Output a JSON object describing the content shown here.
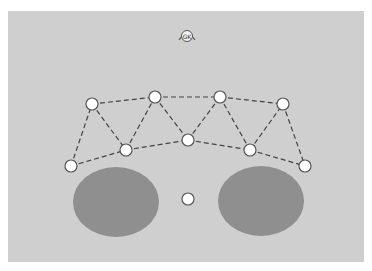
{
  "diagram": {
    "background_color": "#cfcfcf",
    "top_icon": {
      "name": "gk-badge-icon",
      "label": "GK",
      "x": 187,
      "y": 36
    },
    "ellipse_color": "#8f8f8f",
    "ellipses": [
      {
        "id": "left-blob",
        "cx": 116,
        "cy": 202,
        "rx": 43,
        "ry": 35
      },
      {
        "id": "right-blob",
        "cx": 261,
        "cy": 201,
        "rx": 43,
        "ry": 35
      }
    ],
    "node_style": {
      "fill": "#ffffff",
      "stroke": "#555555",
      "r": 6
    },
    "nodes": [
      {
        "id": "n1",
        "x": 71,
        "y": 166
      },
      {
        "id": "n2",
        "x": 92,
        "y": 104
      },
      {
        "id": "n3",
        "x": 126,
        "y": 150
      },
      {
        "id": "n4",
        "x": 155,
        "y": 97
      },
      {
        "id": "n5",
        "x": 188,
        "y": 140
      },
      {
        "id": "n6",
        "x": 220,
        "y": 97
      },
      {
        "id": "n7",
        "x": 250,
        "y": 150
      },
      {
        "id": "n8",
        "x": 283,
        "y": 104
      },
      {
        "id": "n9",
        "x": 305,
        "y": 166
      },
      {
        "id": "n10",
        "x": 188,
        "y": 199
      }
    ],
    "edges": [
      [
        "n2",
        "n4"
      ],
      [
        "n4",
        "n6"
      ],
      [
        "n6",
        "n8"
      ],
      [
        "n1",
        "n3"
      ],
      [
        "n3",
        "n5"
      ],
      [
        "n5",
        "n7"
      ],
      [
        "n7",
        "n9"
      ],
      [
        "n1",
        "n2"
      ],
      [
        "n2",
        "n3"
      ],
      [
        "n3",
        "n4"
      ],
      [
        "n4",
        "n5"
      ],
      [
        "n5",
        "n6"
      ],
      [
        "n6",
        "n7"
      ],
      [
        "n7",
        "n8"
      ],
      [
        "n8",
        "n9"
      ]
    ]
  }
}
